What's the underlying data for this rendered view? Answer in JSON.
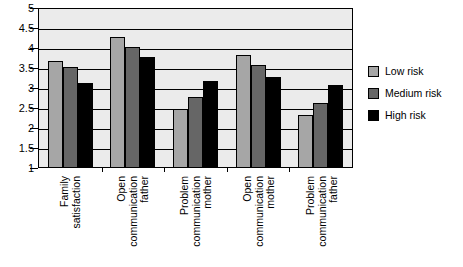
{
  "chart_data": {
    "type": "bar",
    "title": "",
    "subtitle": "",
    "xlabel": "",
    "ylabel": "",
    "ylim": [
      1,
      5
    ],
    "ytick_labels": [
      "5",
      "4.5",
      "4",
      "3.5",
      "3",
      "2.5",
      "2",
      "1.5",
      "1"
    ],
    "ytick_values": [
      5,
      4.5,
      4,
      3.5,
      3,
      2.5,
      2,
      1.5,
      1
    ],
    "grid": true,
    "gridlines_at": [
      5,
      4.5,
      4,
      3.5,
      3,
      2.5,
      2,
      1.5,
      1
    ],
    "legend_position": "right",
    "categories": [
      "Family satisfaction",
      "Open communication father",
      "Problem communication mother",
      "Open communication mother",
      "Problem communication father"
    ],
    "category_lines": [
      [
        "Family",
        "satisfaction"
      ],
      [
        "Open",
        "communication",
        "father"
      ],
      [
        "Problem",
        "communication",
        "mother"
      ],
      [
        "Open",
        "communication",
        "mother"
      ],
      [
        "Problem",
        "communication",
        "father"
      ]
    ],
    "series": [
      {
        "name": "Low risk",
        "color": "#a6a6a6",
        "values": [
          3.65,
          4.25,
          2.45,
          3.8,
          2.3
        ]
      },
      {
        "name": "Medium risk",
        "color": "#666666",
        "values": [
          3.5,
          4.0,
          2.75,
          3.55,
          2.6
        ]
      },
      {
        "name": "High risk",
        "color": "#000000",
        "values": [
          3.1,
          3.75,
          3.15,
          3.25,
          3.05
        ]
      }
    ],
    "plot_background": "#ebebeb",
    "axis_color": "#000000"
  },
  "legend": {
    "items": [
      {
        "label": "Low risk",
        "color": "#a6a6a6"
      },
      {
        "label": "Medium risk",
        "color": "#666666"
      },
      {
        "label": "High risk",
        "color": "#000000"
      }
    ]
  }
}
